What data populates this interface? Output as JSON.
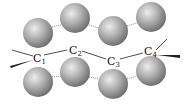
{
  "diagram": {
    "type": "molecular-structure",
    "colors": {
      "atom_highlight": "#e4e4e4",
      "atom_mid": "#a8a8a8",
      "atom_edge": "#6a6a6a",
      "bond": "#222222"
    },
    "carbons": [
      {
        "id": "C1",
        "letter": "C",
        "subscript": "1",
        "x": 36,
        "y": 58
      },
      {
        "id": "C2",
        "letter": "C",
        "subscript": "2",
        "x": 73,
        "y": 50
      },
      {
        "id": "C3",
        "letter": "C",
        "subscript": "3",
        "x": 111,
        "y": 61
      },
      {
        "id": "C4",
        "letter": "C",
        "subscript": "4",
        "x": 148,
        "y": 52
      }
    ],
    "top_atoms": [
      {
        "x": 38,
        "y": 33,
        "r": 15
      },
      {
        "x": 75,
        "y": 18,
        "r": 15
      },
      {
        "x": 113,
        "y": 31,
        "r": 15
      },
      {
        "x": 151,
        "y": 17,
        "r": 15
      }
    ],
    "bottom_atoms": [
      {
        "x": 38,
        "y": 82,
        "r": 15
      },
      {
        "x": 75,
        "y": 72,
        "r": 15
      },
      {
        "x": 113,
        "y": 84,
        "r": 15
      },
      {
        "x": 151,
        "y": 71,
        "r": 15
      }
    ]
  }
}
